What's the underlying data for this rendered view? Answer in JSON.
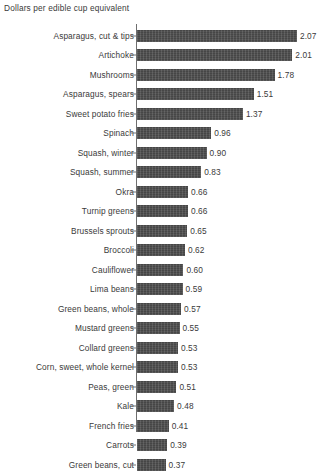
{
  "chart_data": {
    "type": "bar",
    "orientation": "horizontal",
    "title": "Dollars per edible cup equivalent",
    "xlabel": "",
    "ylabel": "",
    "xlim": [
      0,
      2.07
    ],
    "grid": false,
    "legend": null,
    "bar_color": "#4d4d4d",
    "axis_color": "#6f6f6f",
    "categories": [
      "Asparagus, cut & tips",
      "Artichoke",
      "Mushrooms",
      "Asparagus, spears",
      "Sweet potato fries",
      "Spinach",
      "Squash, winter",
      "Squash, summer",
      "Okra",
      "Turnip greens",
      "Brussels sprouts",
      "Broccoli",
      "Cauliflower",
      "Lima beans",
      "Green beans, whole",
      "Mustard greens",
      "Collard greens",
      "Corn, sweet, whole kernel",
      "Peas, green",
      "Kale",
      "French fries",
      "Carrots",
      "Green beans, cut"
    ],
    "values": [
      2.07,
      2.01,
      1.78,
      1.51,
      1.37,
      0.96,
      0.9,
      0.83,
      0.66,
      0.66,
      0.65,
      0.62,
      0.6,
      0.59,
      0.57,
      0.55,
      0.53,
      0.53,
      0.51,
      0.48,
      0.41,
      0.39,
      0.37
    ],
    "value_labels": [
      "2.07",
      "2.01",
      "1.78",
      "1.51",
      "1.37",
      "0.96",
      "0.90",
      "0.83",
      "0.66",
      "0.66",
      "0.65",
      "0.62",
      "0.60",
      "0.59",
      "0.57",
      "0.55",
      "0.53",
      "0.53",
      "0.51",
      "0.48",
      "0.41",
      "0.39",
      "0.37"
    ]
  },
  "footer": {
    "note": ""
  }
}
